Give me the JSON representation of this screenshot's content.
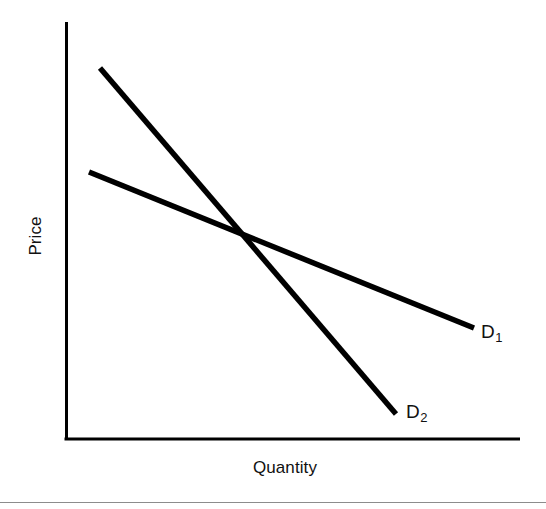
{
  "figure": {
    "background_color": "#ffffff",
    "ink_color": "#111111",
    "footer_rule_color": "#8c8c8c",
    "width": 546,
    "height": 509
  },
  "axes": {
    "y_axis_label": "Price",
    "x_axis_label": "Quantity",
    "axis_color": "#000000",
    "axis_line_width": 3,
    "origin": {
      "x": 66,
      "y": 440
    },
    "y_axis_top": {
      "x": 66,
      "y": 22
    },
    "x_axis_right": {
      "x": 520,
      "y": 440
    }
  },
  "curves": [
    {
      "id": "D1",
      "label_letter": "D",
      "label_subscript": "1",
      "description": "flatter demand curve (less elastic slope on plot)",
      "start": {
        "x": 89,
        "y": 172
      },
      "end": {
        "x": 474,
        "y": 328
      },
      "stroke_width": 5,
      "color": "#000000"
    },
    {
      "id": "D2",
      "label_letter": "D",
      "label_subscript": "2",
      "description": "steeper demand curve",
      "start": {
        "x": 100,
        "y": 68
      },
      "end": {
        "x": 396,
        "y": 414
      },
      "stroke_width": 5,
      "color": "#000000"
    }
  ],
  "intersection": {
    "x": 250,
    "y": 240
  },
  "chart_data": {
    "type": "line",
    "title": "",
    "subtitle": "",
    "xlabel": "Quantity",
    "ylabel": "Price",
    "xlim": [
      0,
      1
    ],
    "ylim": [
      0,
      1
    ],
    "grid": false,
    "legend": "inline-end-labels",
    "axis_ticks": false,
    "tick_labels": {
      "x": [],
      "y": []
    },
    "annotations": [
      {
        "text": "D1",
        "x": 0.915,
        "y": 0.268,
        "note": "end label for flatter curve D sub 1"
      },
      {
        "text": "D2",
        "x": 0.749,
        "y": 0.063,
        "note": "end label for steeper curve D sub 2"
      }
    ],
    "series": [
      {
        "name": "D1",
        "label": "D₁",
        "x": [
          0.051,
          0.999
        ],
        "y": [
          0.641,
          0.268
        ],
        "style": "solid",
        "color": "#000000"
      },
      {
        "name": "D2",
        "label": "D₂",
        "x": [
          0.075,
          0.804
        ],
        "y": [
          0.889,
          0.062
        ],
        "style": "solid",
        "color": "#000000"
      }
    ],
    "intersection_point": {
      "x": 0.405,
      "y": 0.478
    }
  }
}
